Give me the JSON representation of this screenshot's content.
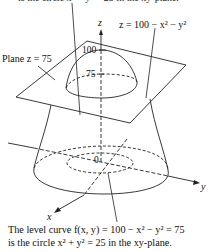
{
  "figure": {
    "top_cut_text": "is the circle x² + y² = 25 in the xy-plane.",
    "labels": {
      "z_axis": "z",
      "x_axis": "x",
      "y_axis": "y",
      "surface_eq": "z = 100 − x² − y²",
      "plane": "Plane z = 75",
      "tick_100": "100",
      "tick_75": "75",
      "origin": "0"
    },
    "caption": {
      "line1": "The level curve f(x, y) = 100 − x² − y² = 75",
      "line2": "is the circle x² + y² = 25 in the xy-plane."
    }
  }
}
